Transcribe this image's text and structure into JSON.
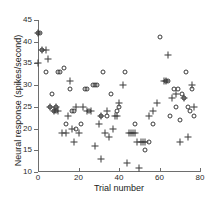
{
  "chart_data": {
    "type": "scatter",
    "title": "",
    "xlabel": "Trial number",
    "ylabel": "Neural response (spikes/second)",
    "xlim": [
      0,
      80
    ],
    "ylim": [
      10,
      45
    ],
    "xticks": [
      0,
      20,
      40,
      60,
      80
    ],
    "yticks": [
      10,
      15,
      20,
      25,
      30,
      35,
      40,
      45
    ],
    "grid": false,
    "legend": "none",
    "marker_color": "#3a3a3a",
    "axis_color": "#6e6e6e",
    "series": [
      {
        "name": "circle-series",
        "marker": "circle",
        "points": [
          [
            0,
            42
          ],
          [
            1,
            42
          ],
          [
            2,
            38
          ],
          [
            4,
            33
          ],
          [
            6,
            25
          ],
          [
            7,
            28
          ],
          [
            8,
            24
          ],
          [
            9,
            25
          ],
          [
            9,
            24
          ],
          [
            10,
            33
          ],
          [
            11,
            33
          ],
          [
            13,
            34
          ],
          [
            14,
            21
          ],
          [
            16,
            29
          ],
          [
            17,
            24
          ],
          [
            18,
            24
          ],
          [
            19,
            20
          ],
          [
            21,
            21
          ],
          [
            23,
            29
          ],
          [
            24,
            29
          ],
          [
            25,
            24
          ],
          [
            27,
            30
          ],
          [
            28,
            30
          ],
          [
            29,
            30
          ],
          [
            31,
            23
          ],
          [
            32,
            33
          ],
          [
            34,
            23
          ],
          [
            36,
            28
          ],
          [
            39,
            24
          ],
          [
            40,
            25
          ],
          [
            43,
            33
          ],
          [
            48,
            21
          ],
          [
            53,
            15
          ],
          [
            55,
            17
          ],
          [
            57,
            21
          ],
          [
            60,
            41
          ],
          [
            63,
            31
          ],
          [
            64,
            31
          ],
          [
            65,
            23
          ],
          [
            67,
            29
          ],
          [
            68,
            25
          ],
          [
            69,
            29
          ],
          [
            70,
            22
          ],
          [
            71,
            28
          ],
          [
            72,
            27
          ],
          [
            73,
            33
          ],
          [
            74,
            25
          ],
          [
            75,
            24
          ],
          [
            76,
            29
          ],
          [
            77,
            23
          ]
        ]
      },
      {
        "name": "plus-series",
        "marker": "plus",
        "points": [
          [
            0,
            35
          ],
          [
            0,
            42
          ],
          [
            2,
            38
          ],
          [
            4,
            38
          ],
          [
            5,
            36
          ],
          [
            6,
            25
          ],
          [
            8,
            24
          ],
          [
            9,
            25
          ],
          [
            10,
            24
          ],
          [
            12,
            19
          ],
          [
            14,
            19
          ],
          [
            15,
            23
          ],
          [
            16,
            31
          ],
          [
            17,
            20
          ],
          [
            18,
            17
          ],
          [
            19,
            25
          ],
          [
            20,
            19
          ],
          [
            22,
            25
          ],
          [
            24,
            24
          ],
          [
            26,
            24
          ],
          [
            28,
            16
          ],
          [
            30,
            21
          ],
          [
            31,
            23
          ],
          [
            31,
            13
          ],
          [
            33,
            19
          ],
          [
            34,
            24
          ],
          [
            35,
            18
          ],
          [
            37,
            20
          ],
          [
            38,
            23
          ],
          [
            39,
            23
          ],
          [
            40,
            26
          ],
          [
            42,
            30
          ],
          [
            44,
            12
          ],
          [
            45,
            19
          ],
          [
            46,
            19
          ],
          [
            47,
            19
          ],
          [
            48,
            19
          ],
          [
            49,
            17
          ],
          [
            50,
            11
          ],
          [
            51,
            17
          ],
          [
            52,
            17
          ],
          [
            53,
            17
          ],
          [
            55,
            23
          ],
          [
            57,
            24
          ],
          [
            59,
            26
          ],
          [
            62,
            31
          ],
          [
            63,
            31
          ],
          [
            64,
            37
          ],
          [
            66,
            27
          ],
          [
            68,
            28
          ],
          [
            70,
            17
          ],
          [
            72,
            27
          ],
          [
            74,
            18
          ],
          [
            76,
            30
          ],
          [
            77,
            25
          ]
        ]
      }
    ]
  },
  "axis_labels": {
    "x": "Trial number",
    "y": "Neural response (spikes/second)"
  }
}
